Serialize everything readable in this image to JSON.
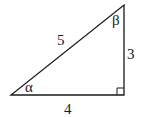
{
  "diagram": {
    "type": "right-triangle",
    "stroke_color": "#1a1a1a",
    "vertices": {
      "left": [
        11,
        95
      ],
      "right": [
        124,
        95
      ],
      "top": [
        124,
        5
      ]
    },
    "sides": {
      "hypotenuse": "5",
      "vertical": "3",
      "base": "4"
    },
    "angles": {
      "left": "α",
      "top": "β"
    },
    "right_angle_marker": true
  }
}
